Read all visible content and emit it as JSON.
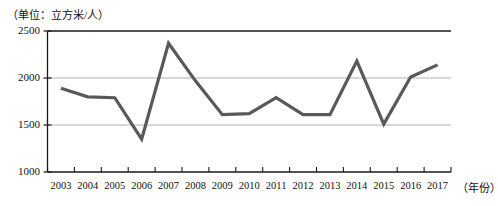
{
  "chart_data": {
    "type": "line",
    "title": "（单位：立方米/人）",
    "xlabel": "（年份）",
    "ylabel": "",
    "categories": [
      "2003",
      "2004",
      "2005",
      "2006",
      "2007",
      "2008",
      "2009",
      "2010",
      "2011",
      "2012",
      "2013",
      "2014",
      "2015",
      "2016",
      "2017"
    ],
    "values": [
      1890,
      1800,
      1790,
      1350,
      2370,
      1970,
      1610,
      1620,
      1790,
      1610,
      1610,
      2180,
      1510,
      2010,
      2140
    ],
    "series": [
      {
        "name": "人均水资源量",
        "values": [
          1890,
          1800,
          1790,
          1350,
          2370,
          1970,
          1610,
          1620,
          1790,
          1610,
          1610,
          2180,
          1510,
          2010,
          2140
        ]
      }
    ],
    "ylim": [
      1000,
      2500
    ],
    "yticks": [
      1000,
      1500,
      2000,
      2500
    ],
    "ytick_labels": [
      "1000",
      "1500",
      "2000",
      "2500"
    ],
    "grid": true,
    "legend": "none",
    "line_color": "#595959",
    "grid_color": "#a8a8a8",
    "axis_color": "#1a1a1a"
  }
}
